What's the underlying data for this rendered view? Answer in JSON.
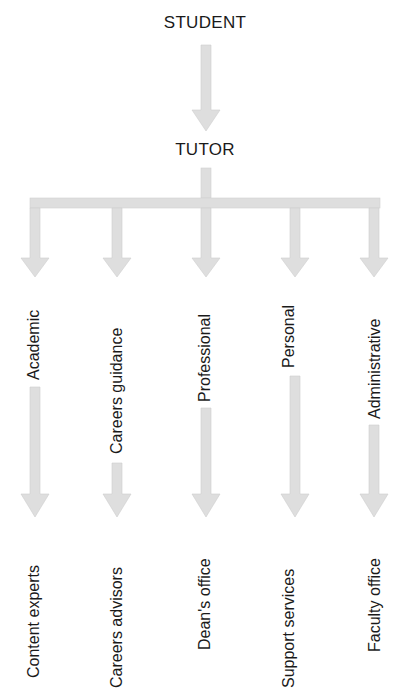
{
  "diagram": {
    "top": "STUDENT",
    "middle": "TUTOR",
    "roles": [
      {
        "role": "Academic",
        "referral": "Content experts"
      },
      {
        "role": "Careers guidance",
        "referral": "Careers advisors"
      },
      {
        "role": "Professional",
        "referral": "Dean's office"
      },
      {
        "role": "Personal",
        "referral": "Support services"
      },
      {
        "role": "Administrative",
        "referral": "Faculty office"
      }
    ],
    "colors": {
      "arrow_fill": "#dedede",
      "text": "#1a1a1a"
    }
  }
}
